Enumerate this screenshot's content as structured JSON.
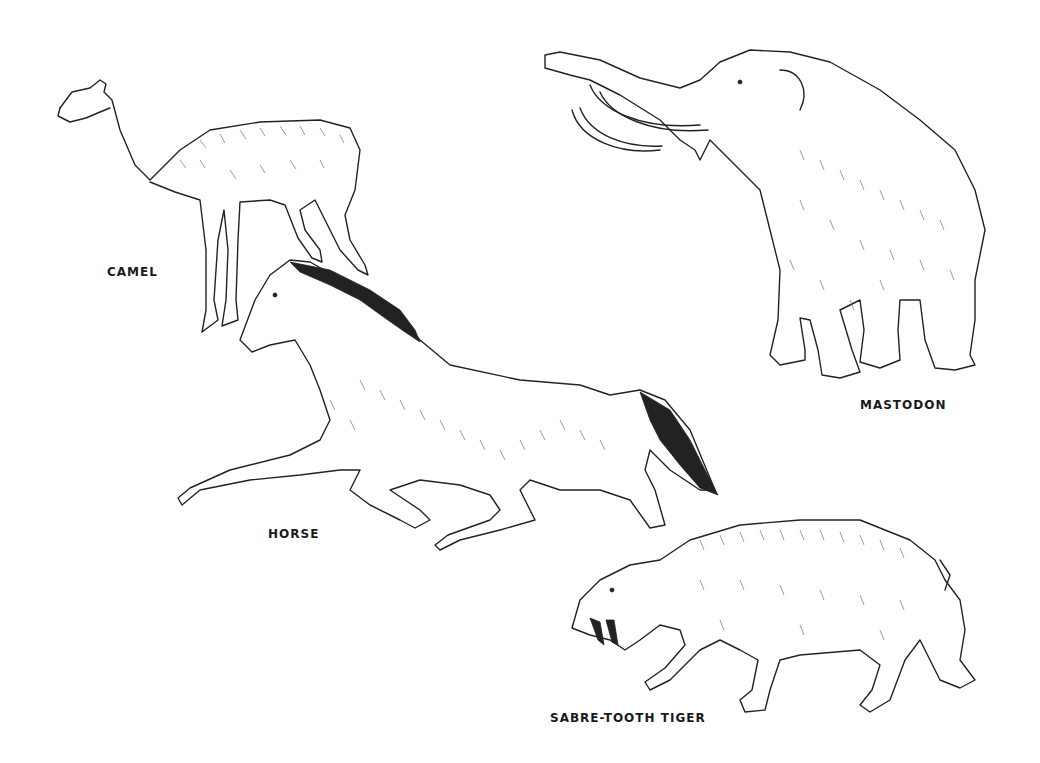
{
  "illustration": {
    "title": "Prehistoric animals line drawing",
    "animals": [
      {
        "id": "camel",
        "label": "CAMEL"
      },
      {
        "id": "mastodon",
        "label": "MASTODON"
      },
      {
        "id": "horse",
        "label": "HORSE"
      },
      {
        "id": "sabre-tooth-tiger",
        "label": "SABRE-TOOTH TIGER"
      }
    ]
  }
}
